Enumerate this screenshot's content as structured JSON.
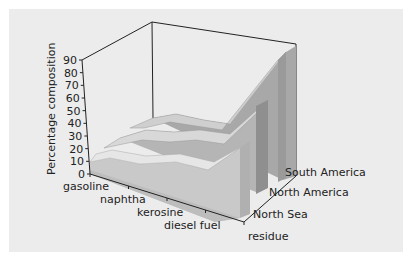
{
  "chart_data": {
    "type": "area",
    "subtype": "3d-ribbon",
    "title": "",
    "xlabel": "",
    "ylabel": "Percentage composition",
    "zlabel": "",
    "ylim": [
      0,
      90
    ],
    "yticks": [
      0,
      10,
      20,
      30,
      40,
      50,
      60,
      70,
      80,
      90
    ],
    "categories": [
      "gasoline",
      "naphtha",
      "kerosine",
      "diesel fuel",
      "residue"
    ],
    "series": [
      {
        "name": "North Sea",
        "values": [
          10,
          8,
          11,
          14,
          35
        ]
      },
      {
        "name": "North America",
        "values": [
          10,
          10,
          10,
          12,
          55
        ]
      },
      {
        "name": "South America",
        "values": [
          8,
          7,
          8,
          10,
          80
        ]
      }
    ],
    "grid": false,
    "legend": "series labels on depth axis (right)"
  },
  "labels": {
    "ylabel": "Percentage composition",
    "yticks": [
      "0",
      "10",
      "20",
      "30",
      "40",
      "50",
      "60",
      "70",
      "80",
      "90"
    ],
    "categories": [
      "gasoline",
      "naphtha",
      "kerosine",
      "diesel fuel",
      "residue"
    ],
    "series": [
      "North Sea",
      "North America",
      "South America"
    ]
  },
  "colors": {
    "panel_bg": "#ececec",
    "front_top": "#e6e6e6",
    "front_side": "#c9c9c9",
    "mid_top": "#d8d8d8",
    "mid_side": "#b5b5b5",
    "back_top": "#cfcfcf",
    "back_side": "#a8a8a8",
    "axis": "#222222"
  }
}
